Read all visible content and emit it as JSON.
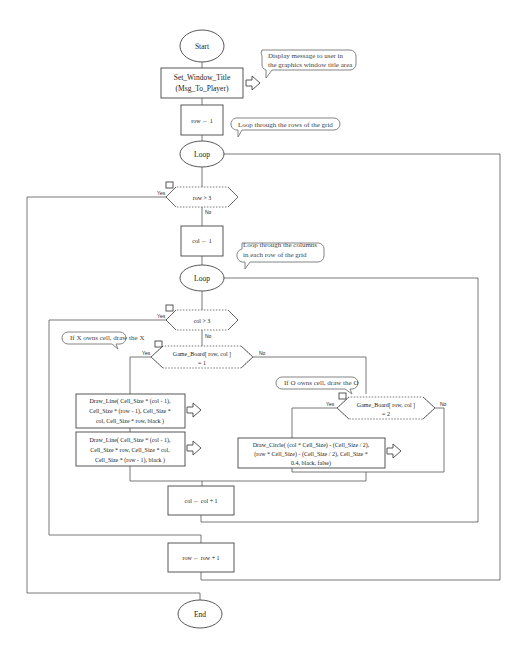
{
  "flowchart": {
    "start": "Start",
    "end": "End",
    "set_title": {
      "line1": "Set_Window_Title",
      "line2": "(Msg_To_Player)"
    },
    "row_init": "row ← 1",
    "outer_loop": "Loop",
    "outer_cond": "row > 3",
    "col_init": "col ← 1",
    "inner_loop": "Loop",
    "inner_cond": "col > 3",
    "x_cond": {
      "line1": "Game_Board[ row,  col ]",
      "line2": "= 1"
    },
    "o_cond": {
      "line1": "Game_Board[ row,  col ]",
      "line2": "= 2"
    },
    "draw_line1": {
      "line1": "Draw_Line( Cell_Size  *  (col - 1),",
      "line2": "Cell_Size  *  (row - 1),  Cell_Size  *",
      "line3": "col,  Cell_Size  *  row,  black )"
    },
    "draw_line2": {
      "line1": "Draw_Line( Cell_Size  *  (col - 1),",
      "line2": "Cell_Size  *  row,  Cell_Size  *  col,",
      "line3": "Cell_Size  *  (row - 1),  black )"
    },
    "draw_circle": {
      "line1": "Draw_Circle( (col  *  Cell_Size)  -  (Cell_Size / 2),",
      "line2": "(row  *  Cell_Size)  -  (Cell_Size / 2),  Cell_Size *",
      "line3": "0.4,  black,  false)"
    },
    "col_inc": "col  ←  col  +  1",
    "row_inc": "row  ←  row  +  1",
    "yes": "Yes",
    "no": "No"
  },
  "comments": {
    "title": {
      "line1": "Display message to user in",
      "line2": "the graphics window title area"
    },
    "rows": "Loop through the rows of the grid",
    "cols": {
      "line1": "Loop through the columns",
      "line2": "in each row of the grid"
    },
    "x": "If X owns cell, draw the X",
    "o": "If O owns cell, draw the O"
  }
}
